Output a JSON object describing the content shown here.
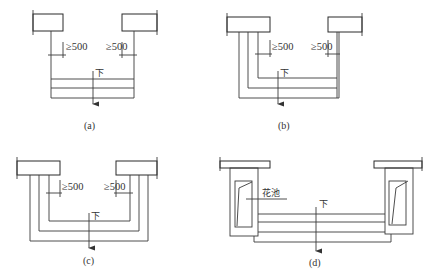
{
  "figure": {
    "panels": [
      {
        "id": "a",
        "caption": "(a)",
        "dimension_left": "≥500",
        "dimension_right": "≥500",
        "direction_label": "下",
        "description": "Straight stair between two walls with ≥500 clearance each side"
      },
      {
        "id": "b",
        "caption": "(b)",
        "dimension_left": "≥500",
        "dimension_right": "≥500",
        "direction_label": "下",
        "description": "Steps wrapping one side (L-shape) with ≥500 clearance"
      },
      {
        "id": "c",
        "caption": "(c)",
        "dimension_left": "≥500",
        "dimension_right": "≥500",
        "direction_label": "下",
        "description": "Steps wrapping both sides (U-shape) with ≥500 clearance"
      },
      {
        "id": "d",
        "caption": "(d)",
        "planter_label": "花池",
        "direction_label": "下",
        "description": "Straight stair flanked by planters on both sides"
      }
    ],
    "colors": {
      "line": "#3a3a3a",
      "background": "#ffffff"
    }
  }
}
